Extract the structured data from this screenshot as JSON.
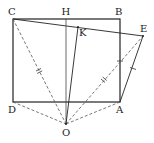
{
  "diagram": {
    "type": "geometry",
    "labels": {
      "C": "C",
      "H": "H",
      "B": "B",
      "K": "K",
      "E": "E",
      "D": "D",
      "A": "A",
      "O": "O"
    },
    "points": {
      "C": [
        13,
        19
      ],
      "H": [
        66,
        19
      ],
      "B": [
        120,
        19
      ],
      "K": [
        78,
        27
      ],
      "E": [
        143,
        36
      ],
      "D": [
        13,
        102
      ],
      "A": [
        120,
        102
      ],
      "O": [
        66,
        124
      ]
    },
    "solid_segments": [
      [
        "C",
        "B"
      ],
      [
        "B",
        "A"
      ],
      [
        "A",
        "D"
      ],
      [
        "D",
        "C"
      ],
      [
        "C",
        "E"
      ],
      [
        "H",
        "O"
      ],
      [
        "K",
        "O"
      ],
      [
        "A",
        "E"
      ]
    ],
    "dashed_segments": [
      [
        "C",
        "O"
      ],
      [
        "D",
        "O"
      ],
      [
        "A",
        "O"
      ],
      [
        "O",
        "E"
      ]
    ],
    "tick_marks": [
      {
        "segment": [
          "C",
          "O"
        ],
        "count": 2
      },
      {
        "segment": [
          "O",
          "E"
        ],
        "count": 2
      },
      {
        "segment": [
          "B",
          "A"
        ],
        "count": 1
      },
      {
        "segment": [
          "A",
          "E"
        ],
        "count": 1
      }
    ],
    "colors": {
      "stroke": "#222222",
      "dashed": "#555555",
      "background": "#ffffff"
    }
  }
}
